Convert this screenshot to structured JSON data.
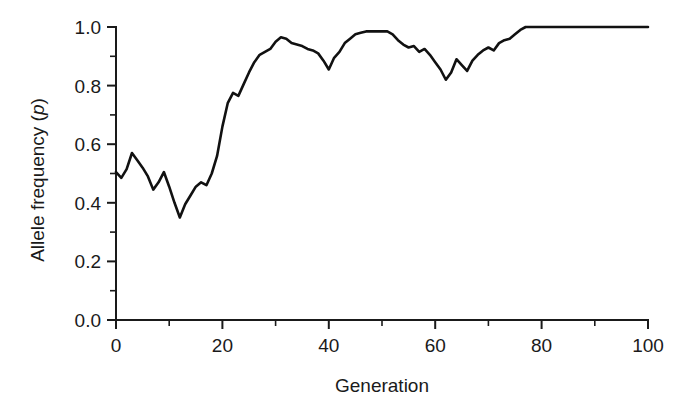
{
  "figure": {
    "background_color": "#ffffff",
    "line_color": "#111111",
    "text_color": "#1a1a1a"
  },
  "axes": {
    "x_title": "Generation",
    "y_title_main": "Allele frequency (",
    "y_title_italic": "p",
    "y_title_close": ")",
    "x_tick_labels": [
      "0",
      "20",
      "40",
      "60",
      "80",
      "100"
    ],
    "y_tick_labels": [
      "0.0",
      "0.2",
      "0.4",
      "0.6",
      "0.8",
      "1.0"
    ]
  },
  "chart_data": {
    "type": "line",
    "title": "",
    "xlabel": "Generation",
    "ylabel": "Allele frequency (p)",
    "xlim": [
      0,
      100
    ],
    "ylim": [
      0.0,
      1.0
    ],
    "grid": false,
    "legend": null,
    "x_major_ticks": [
      0,
      20,
      40,
      60,
      80,
      100
    ],
    "x_minor_ticks": [
      10,
      30,
      50,
      70,
      90
    ],
    "y_major_ticks": [
      0.0,
      0.2,
      0.4,
      0.6,
      0.8,
      1.0
    ],
    "y_minor_ticks": [
      0.1,
      0.3,
      0.5,
      0.7,
      0.9
    ],
    "series": [
      {
        "name": "Allele frequency (p)",
        "color": "#111111",
        "x": [
          0,
          1,
          2,
          3,
          4,
          5,
          6,
          7,
          8,
          9,
          10,
          11,
          12,
          13,
          14,
          15,
          16,
          17,
          18,
          19,
          20,
          21,
          22,
          23,
          24,
          25,
          26,
          27,
          28,
          29,
          30,
          31,
          32,
          33,
          34,
          35,
          36,
          37,
          38,
          39,
          40,
          41,
          42,
          43,
          44,
          45,
          46,
          47,
          48,
          49,
          50,
          51,
          52,
          53,
          54,
          55,
          56,
          57,
          58,
          59,
          60,
          61,
          62,
          63,
          64,
          65,
          66,
          67,
          68,
          69,
          70,
          71,
          72,
          73,
          74,
          75,
          76,
          77,
          78,
          79,
          80,
          81,
          82,
          83,
          84,
          85,
          86,
          87,
          88,
          89,
          90,
          91,
          92,
          93,
          94,
          95,
          96,
          97,
          98,
          99,
          100
        ],
        "y": [
          0.505,
          0.485,
          0.515,
          0.57,
          0.545,
          0.52,
          0.49,
          0.445,
          0.47,
          0.505,
          0.455,
          0.4,
          0.35,
          0.395,
          0.425,
          0.455,
          0.47,
          0.46,
          0.5,
          0.56,
          0.66,
          0.74,
          0.775,
          0.765,
          0.805,
          0.845,
          0.88,
          0.905,
          0.915,
          0.925,
          0.95,
          0.965,
          0.96,
          0.945,
          0.94,
          0.935,
          0.925,
          0.92,
          0.91,
          0.885,
          0.855,
          0.895,
          0.915,
          0.945,
          0.96,
          0.975,
          0.98,
          0.985,
          0.985,
          0.985,
          0.985,
          0.985,
          0.975,
          0.955,
          0.94,
          0.93,
          0.935,
          0.915,
          0.925,
          0.905,
          0.88,
          0.855,
          0.82,
          0.845,
          0.89,
          0.87,
          0.85,
          0.885,
          0.905,
          0.92,
          0.93,
          0.92,
          0.945,
          0.955,
          0.96,
          0.975,
          0.99,
          1.0,
          1.0,
          1.0,
          1.0,
          1.0,
          1.0,
          1.0,
          1.0,
          1.0,
          1.0,
          1.0,
          1.0,
          1.0,
          1.0,
          1.0,
          1.0,
          1.0,
          1.0,
          1.0,
          1.0,
          1.0,
          1.0,
          1.0,
          1.0
        ]
      }
    ]
  }
}
